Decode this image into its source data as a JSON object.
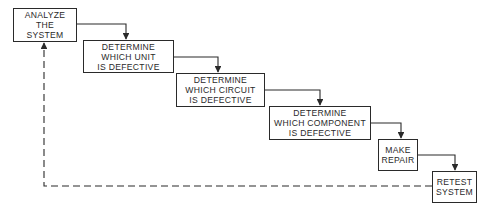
{
  "diagram": {
    "type": "flowchart",
    "steps": [
      {
        "id": "analyze",
        "lines": [
          "ANALYZE",
          "THE",
          "SYSTEM"
        ],
        "box": [
          13,
          8,
          64,
          34
        ]
      },
      {
        "id": "unit",
        "lines": [
          "DETERMINE",
          "WHICH UNIT",
          "IS DEFECTIVE"
        ],
        "box": [
          83,
          40,
          91,
          33
        ]
      },
      {
        "id": "circuit",
        "lines": [
          "DETERMINE",
          "WHICH CIRCUIT",
          "IS DEFECTIVE"
        ],
        "box": [
          176,
          73,
          89,
          34
        ]
      },
      {
        "id": "component",
        "lines": [
          "DETERMINE",
          "WHICH COMPONENT",
          "IS DEFECTIVE"
        ],
        "box": [
          269,
          106,
          102,
          34
        ]
      },
      {
        "id": "repair",
        "lines": [
          "MAKE",
          "REPAIR"
        ],
        "box": [
          378,
          139,
          40,
          32
        ]
      },
      {
        "id": "retest",
        "lines": [
          "RETEST",
          "SYSTEM"
        ],
        "box": [
          432,
          171,
          45,
          32
        ]
      }
    ],
    "connectors": [
      {
        "from": "analyze",
        "to": "unit",
        "style": "solid",
        "path": "M77,24 L126,24 L126,40"
      },
      {
        "from": "unit",
        "to": "circuit",
        "style": "solid",
        "path": "M174,57 L218,57 L218,73"
      },
      {
        "from": "circuit",
        "to": "component",
        "style": "solid",
        "path": "M265,90 L320,90 L320,106"
      },
      {
        "from": "component",
        "to": "repair",
        "style": "solid",
        "path": "M371,123 L401,123 L401,139"
      },
      {
        "from": "repair",
        "to": "retest",
        "style": "solid",
        "path": "M418,155 L455,155 L455,171"
      },
      {
        "from": "retest",
        "to": "analyze",
        "style": "dashed",
        "path": "M432,186 L44,186 L44,42"
      }
    ],
    "colors": {
      "line": "#2a2a2a",
      "background": "#ffffff"
    }
  }
}
